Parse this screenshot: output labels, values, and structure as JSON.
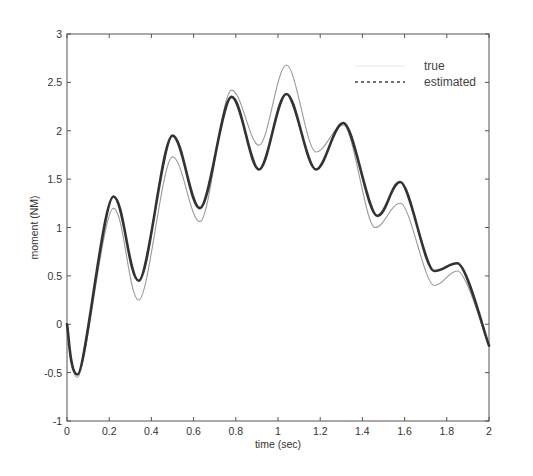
{
  "chart_data": {
    "type": "line",
    "title": "",
    "xlabel": "time (sec)",
    "ylabel": "moment (NM)",
    "xlim": [
      0,
      2
    ],
    "ylim": [
      -1,
      3
    ],
    "xticks": [
      "0",
      "0.2",
      "0.4",
      "0.6",
      "0.8",
      "1",
      "1.2",
      "1.4",
      "1.6",
      "1.8",
      "2"
    ],
    "yticks": [
      "-1",
      "-0.5",
      "0",
      "0.5",
      "1",
      "1.5",
      "2",
      "2.5",
      "3"
    ],
    "grid": false,
    "legend": {
      "position": "upper right",
      "entries": [
        "true",
        "estimated"
      ]
    },
    "series": [
      {
        "name": "true",
        "style": "thin light gray solid",
        "color": "#9a9a9a",
        "x": [
          0,
          0.05,
          0.22,
          0.34,
          0.5,
          0.63,
          0.78,
          0.91,
          1.04,
          1.18,
          1.31,
          1.46,
          1.58,
          1.74,
          1.85,
          2.0
        ],
        "y": [
          0,
          -0.55,
          1.2,
          0.25,
          1.73,
          1.06,
          2.42,
          1.85,
          2.68,
          1.78,
          2.06,
          1.0,
          1.25,
          0.4,
          0.55,
          -0.22
        ]
      },
      {
        "name": "estimated",
        "style": "thick dark dashed",
        "color": "#333333",
        "x": [
          0,
          0.05,
          0.22,
          0.34,
          0.5,
          0.63,
          0.78,
          0.91,
          1.04,
          1.18,
          1.31,
          1.47,
          1.58,
          1.74,
          1.85,
          2.0
        ],
        "y": [
          0,
          -0.52,
          1.32,
          0.45,
          1.95,
          1.2,
          2.35,
          1.6,
          2.38,
          1.6,
          2.08,
          1.12,
          1.47,
          0.55,
          0.63,
          -0.22
        ]
      }
    ]
  }
}
